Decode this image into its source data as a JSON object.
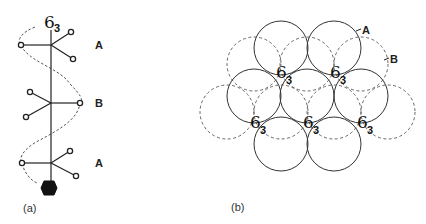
{
  "panel_a": {
    "caption": "(a)",
    "axis_label": {
      "main": "6",
      "sub": "3"
    },
    "layer_labels": [
      {
        "text": "A",
        "x": 99,
        "y": 49
      },
      {
        "text": "B",
        "x": 99,
        "y": 107
      },
      {
        "text": "A",
        "x": 99,
        "y": 167
      }
    ],
    "nodes": [
      {
        "layer": "A",
        "cx": 51,
        "cy": 45,
        "arms": [
          [
            21,
            45
          ],
          [
            71,
            32
          ],
          [
            73,
            59
          ]
        ]
      },
      {
        "layer": "B",
        "cx": 51,
        "cy": 103,
        "arms": [
          [
            30,
            92
          ],
          [
            26,
            117
          ],
          [
            80,
            103
          ]
        ]
      },
      {
        "layer": "A",
        "cx": 51,
        "cy": 163,
        "arms": [
          [
            22,
            163
          ],
          [
            70,
            151
          ],
          [
            76,
            176
          ]
        ]
      }
    ]
  },
  "panel_b": {
    "caption": "(b)",
    "layer_labels": [
      {
        "text": "A",
        "x": 362,
        "y": 34
      },
      {
        "text": "B",
        "x": 390,
        "y": 63
      }
    ],
    "solid_circles_A": [
      [
        281,
        48
      ],
      [
        334,
        48
      ],
      [
        254,
        96
      ],
      [
        307,
        96
      ],
      [
        361,
        96
      ],
      [
        281,
        144
      ],
      [
        334,
        144
      ]
    ],
    "dashed_circles_B": [
      [
        254,
        64
      ],
      [
        307,
        64
      ],
      [
        361,
        64
      ],
      [
        227,
        112
      ],
      [
        281,
        112
      ],
      [
        334,
        112
      ],
      [
        388,
        112
      ]
    ],
    "radius": 27,
    "screw_axis_labels": [
      {
        "main": "6",
        "sub": "3",
        "x": 276,
        "y": 78
      },
      {
        "main": "6",
        "sub": "3",
        "x": 330,
        "y": 78
      },
      {
        "main": "6",
        "sub": "3",
        "x": 250,
        "y": 128
      },
      {
        "main": "6",
        "sub": "3",
        "x": 303,
        "y": 128
      },
      {
        "main": "6",
        "sub": "3",
        "x": 357,
        "y": 128
      }
    ]
  }
}
